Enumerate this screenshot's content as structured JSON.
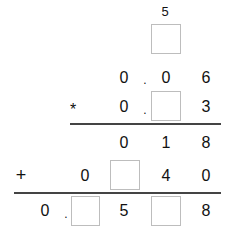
{
  "carry": {
    "value": "5"
  },
  "row1": {
    "d1": "0",
    "dot": ".",
    "d2": "0",
    "d3": "6"
  },
  "row2": {
    "op": "*",
    "d1": "0",
    "dot": ".",
    "d3": "3"
  },
  "partial1": {
    "d1": "0",
    "d2": "1",
    "d3": "8"
  },
  "partial2": {
    "op": "+",
    "d0": "0",
    "d2": "4",
    "d3": "0"
  },
  "result": {
    "d0": "0",
    "dot": ".",
    "d2": "5",
    "d4": "8"
  }
}
